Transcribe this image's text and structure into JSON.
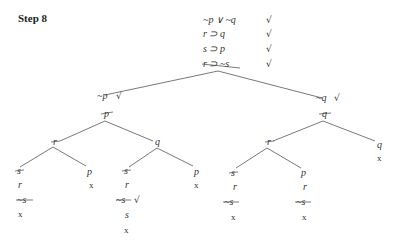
{
  "title": "Step 8",
  "premises": [
    {
      "formula": "~p ∨ ~q",
      "check": "√"
    },
    {
      "formula": "r ⊃ q",
      "check": "√"
    },
    {
      "formula": "s ⊃ p",
      "check": "√"
    },
    {
      "formula": "r ⊃ ~s",
      "check": "√",
      "struck": true
    }
  ],
  "tree": {
    "left": {
      "head": "~p",
      "head_check": "√",
      "node": "p",
      "node_struck": true,
      "branches": {
        "r": {
          "label": "r",
          "struck": true,
          "left": {
            "label": "s",
            "struck": true,
            "below": [
              "r",
              "~s",
              "x"
            ],
            "below_struck": [
              false,
              true,
              false
            ]
          },
          "right": {
            "label": "p",
            "below": [
              "x"
            ]
          }
        },
        "q": {
          "label": "q",
          "left": {
            "label": "s",
            "struck": true,
            "below": [
              "r",
              "~s",
              "s",
              "x"
            ],
            "below_struck": [
              false,
              true,
              false,
              false
            ],
            "check": "√"
          },
          "right": {
            "label": "p",
            "below": [
              "x"
            ]
          }
        }
      }
    },
    "right": {
      "head": "~q",
      "head_check": "√",
      "node": "q",
      "node_struck": true,
      "branches": {
        "r": {
          "label": "r",
          "struck": true,
          "left": {
            "label": "s",
            "struck": true,
            "below": [
              "r",
              "~s",
              "x"
            ],
            "below_struck": [
              false,
              true,
              false
            ]
          },
          "right": {
            "label": "p",
            "below": [
              "r",
              "~s",
              "x"
            ],
            "below_struck": [
              false,
              true,
              false
            ]
          }
        },
        "q": {
          "label": "q",
          "below": [
            "x"
          ]
        }
      }
    }
  },
  "closed_mark": "x"
}
